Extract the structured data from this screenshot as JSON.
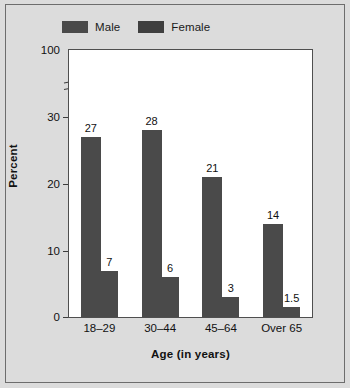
{
  "chart_data": {
    "type": "bar",
    "title": "",
    "xlabel": "Age (in years)",
    "ylabel": "Percent",
    "categories": [
      "18–29",
      "30–44",
      "45–64",
      "Over 65"
    ],
    "series": [
      {
        "name": "Male",
        "values": [
          27,
          28,
          21,
          14
        ],
        "color": "#4a4a4a"
      },
      {
        "name": "Female",
        "values": [
          7,
          6,
          3,
          1.5
        ],
        "color": "#4a4a4a"
      }
    ],
    "value_labels": {
      "Male": [
        "27",
        "28",
        "21",
        "14"
      ],
      "Female": [
        "7",
        "6",
        "3",
        "1.5"
      ]
    },
    "ylim": [
      0,
      100
    ],
    "yticks": [
      0,
      10,
      20,
      30,
      100
    ],
    "ytick_labels": [
      "0",
      "10",
      "20",
      "30",
      "100"
    ],
    "y_axis_break": true,
    "y_axis_break_between": [
      30,
      100
    ],
    "grid": false,
    "legend_position": "top-left"
  },
  "legend": {
    "entries": [
      {
        "label": "Male",
        "swatch_color": "#4a4a4a"
      },
      {
        "label": "Female",
        "swatch_color": "#3f3f3f"
      }
    ]
  },
  "figure": {
    "background_color": "#dcdcdc",
    "plot_background_color": "#ffffff",
    "border_color": "#6d6d6d",
    "axis_color": "#4f4f4f"
  }
}
